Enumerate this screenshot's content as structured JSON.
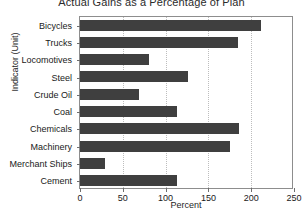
{
  "chart_data": {
    "type": "bar",
    "orientation": "horizontal",
    "title": "Actual Gains as a Percentage of Plan",
    "xlabel": "Percent",
    "ylabel": "Indicator (Unit)",
    "categories": [
      "Bicycles",
      "Trucks",
      "Locomotives",
      "Steel",
      "Crude Oil",
      "Coal",
      "Chemicals",
      "Machinery",
      "Merchant Ships",
      "Cement"
    ],
    "values": [
      212,
      184,
      81,
      126,
      69,
      113,
      186,
      175,
      29,
      113
    ],
    "xlim": [
      0,
      250
    ],
    "xticks": [
      0,
      50,
      100,
      150,
      200,
      250
    ],
    "xtick_labels": [
      "0",
      "50",
      "100",
      "150",
      "200",
      "250"
    ],
    "grid": "vertical-dotted",
    "legend": "none",
    "bar_color": "#3f3f3f",
    "grid_color": "#bdbdbd",
    "frame_color": "#8d8d8d",
    "background_color": "#ffffff"
  }
}
